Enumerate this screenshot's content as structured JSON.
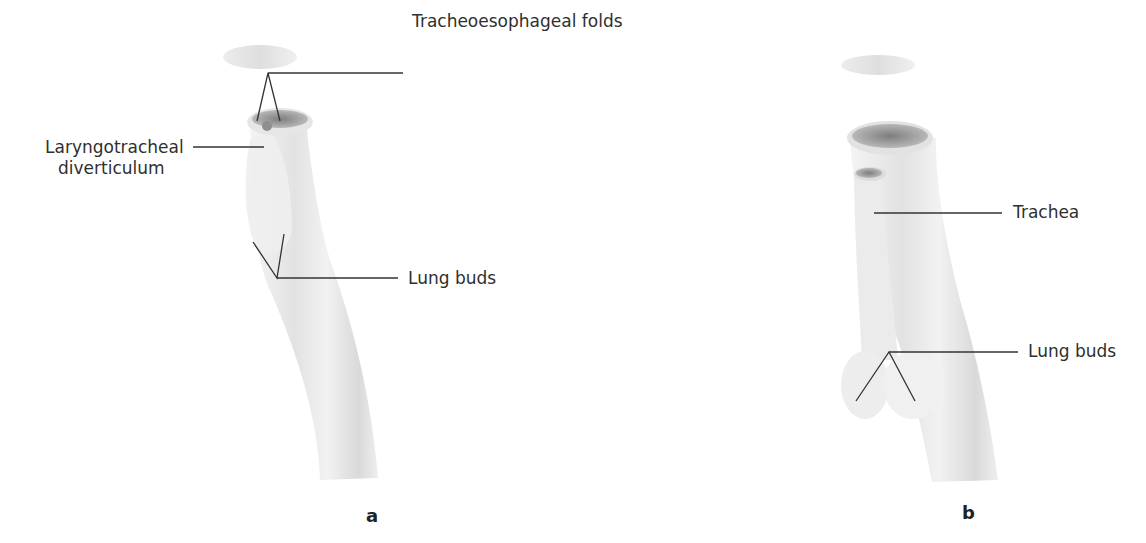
{
  "figure": {
    "panels": [
      {
        "id": "a",
        "letter": "a",
        "labels": {
          "tracheoesophageal_folds": "Tracheoesophageal folds",
          "laryngotracheal_line1": "Laryngotracheal",
          "laryngotracheal_line2": "diverticulum",
          "lung_buds": "Lung buds"
        }
      },
      {
        "id": "b",
        "letter": "b",
        "labels": {
          "trachea": "Trachea",
          "lung_buds": "Lung buds"
        }
      }
    ],
    "colors": {
      "leader_line": "#333333",
      "tissue_light": "#ececec",
      "tissue_mid": "#d2d2d2",
      "lumen_dark": "#8a8a8a"
    }
  }
}
